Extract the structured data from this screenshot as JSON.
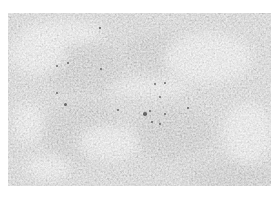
{
  "image": {
    "description": "Grayscale textured surface photograph (micrograph-like), mottled light and mid gray with scattered dark specks",
    "colors": {
      "background": "#ffffff",
      "base_gray": "#bdbdbd",
      "light_patch": "#e6e6e6",
      "dark_patch": "#a2a2a2",
      "speck": "#4a4a4a"
    },
    "frame": {
      "left": 8,
      "top": 13,
      "width": 263,
      "height": 173
    },
    "light_patches": [
      {
        "cx": 30,
        "cy": 40,
        "rx": 28,
        "ry": 22
      },
      {
        "cx": 55,
        "cy": 20,
        "rx": 40,
        "ry": 12
      },
      {
        "cx": 140,
        "cy": 75,
        "rx": 40,
        "ry": 8
      },
      {
        "cx": 200,
        "cy": 45,
        "rx": 45,
        "ry": 25
      },
      {
        "cx": 100,
        "cy": 130,
        "rx": 30,
        "ry": 18
      },
      {
        "cx": 40,
        "cy": 155,
        "rx": 22,
        "ry": 12
      },
      {
        "cx": 240,
        "cy": 120,
        "rx": 25,
        "ry": 30
      },
      {
        "cx": 20,
        "cy": 110,
        "rx": 15,
        "ry": 20
      }
    ],
    "dark_patches": [
      {
        "cx": 75,
        "cy": 55,
        "rx": 40,
        "ry": 25
      },
      {
        "cx": 150,
        "cy": 40,
        "rx": 35,
        "ry": 18
      },
      {
        "cx": 75,
        "cy": 120,
        "rx": 40,
        "ry": 30
      },
      {
        "cx": 165,
        "cy": 120,
        "rx": 40,
        "ry": 25
      },
      {
        "cx": 225,
        "cy": 165,
        "rx": 45,
        "ry": 15
      }
    ],
    "specks": [
      {
        "x": 57,
        "y": 66,
        "r": 1.2
      },
      {
        "x": 68,
        "y": 63,
        "r": 1.0
      },
      {
        "x": 101,
        "y": 69,
        "r": 1.0
      },
      {
        "x": 57,
        "y": 93,
        "r": 1.4
      },
      {
        "x": 65,
        "y": 104,
        "r": 1.5
      },
      {
        "x": 155,
        "y": 84,
        "r": 1.2
      },
      {
        "x": 165,
        "y": 83,
        "r": 1.0
      },
      {
        "x": 160,
        "y": 97,
        "r": 1.0
      },
      {
        "x": 145,
        "y": 114,
        "r": 1.8
      },
      {
        "x": 150,
        "y": 111,
        "r": 1.2
      },
      {
        "x": 152,
        "y": 122,
        "r": 1.3
      },
      {
        "x": 160,
        "y": 124,
        "r": 1.0
      },
      {
        "x": 165,
        "y": 114,
        "r": 1.0
      },
      {
        "x": 118,
        "y": 110,
        "r": 1.0
      },
      {
        "x": 188,
        "y": 108,
        "r": 0.9
      },
      {
        "x": 100,
        "y": 28,
        "r": 0.8
      }
    ]
  }
}
